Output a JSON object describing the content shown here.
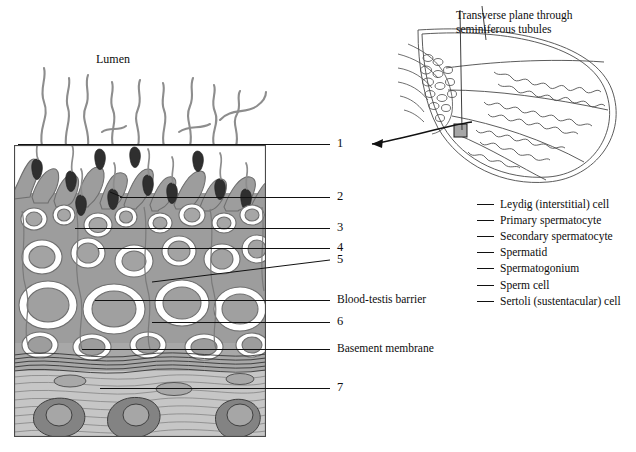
{
  "figure": {
    "type": "histology-diagram",
    "lumen_label": "Lumen"
  },
  "inset": {
    "title": "Transverse plane through\nseminiferous tubules",
    "arrow": "magnification-arrow"
  },
  "callouts": [
    {
      "id": "c1",
      "label": "1",
      "line_y": 144,
      "line_x1": 18,
      "line_x2": 330,
      "text_x": 337,
      "text_y": 137
    },
    {
      "id": "c2",
      "label": "2",
      "line_y": 197,
      "line_x1": 120,
      "line_x2": 330,
      "text_x": 337,
      "text_y": 190
    },
    {
      "id": "c3",
      "label": "3",
      "line_y": 228,
      "line_x1": 75,
      "line_x2": 330,
      "text_x": 337,
      "text_y": 221
    },
    {
      "id": "c4",
      "label": "4",
      "line_y": 248,
      "line_x1": 98,
      "line_x2": 330,
      "text_x": 337,
      "text_y": 241
    },
    {
      "id": "c5",
      "label": "5",
      "line_y": 260,
      "line_x1": 160,
      "line_x2": 330,
      "text_x": 337,
      "text_y": 254
    },
    {
      "id": "c6",
      "label": "Blood-testis barrier",
      "line_y": 300,
      "line_x1": 95,
      "line_x2": 330,
      "text_x": 337,
      "text_y": 293
    },
    {
      "id": "c7",
      "label": "6",
      "line_y": 322,
      "line_x1": 152,
      "line_x2": 330,
      "text_x": 337,
      "text_y": 315
    },
    {
      "id": "c8",
      "label": "Basement membrane",
      "line_y": 349,
      "line_x1": 82,
      "line_x2": 330,
      "text_x": 337,
      "text_y": 342
    },
    {
      "id": "c9",
      "label": "7",
      "line_y": 388,
      "line_x1": 100,
      "line_x2": 330,
      "text_x": 337,
      "text_y": 381
    }
  ],
  "legend": {
    "items": [
      "Leydig (interstitial) cell",
      "Primary spermatocyte",
      "Secondary spermatocyte",
      "Spermatid",
      "Spermatogonium",
      "Sperm cell",
      "Sertoli (sustentacular) cell"
    ]
  },
  "colors": {
    "ink": "#111111",
    "cytoplasm_mid": "#9a9a9a",
    "cytoplasm_light": "#b9b9b9",
    "nucleus_dark": "#3a3a3a",
    "leydig_fill": "#8a8a8a",
    "interstitium": "#c9c9c9",
    "white": "#ffffff"
  }
}
